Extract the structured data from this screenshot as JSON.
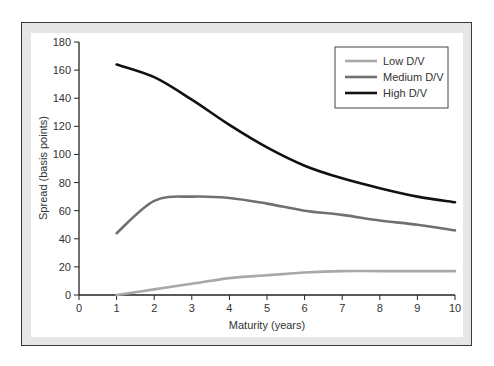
{
  "chart_data": {
    "type": "line",
    "title": "",
    "xlabel": "Maturity (years)",
    "ylabel": "Spread (basis points)",
    "xlim": [
      0,
      10
    ],
    "ylim": [
      0,
      180
    ],
    "xticks": [
      0,
      1,
      2,
      3,
      4,
      5,
      6,
      7,
      8,
      9,
      10
    ],
    "yticks": [
      0,
      20,
      40,
      60,
      80,
      100,
      120,
      140,
      160,
      180
    ],
    "grid": false,
    "legend_position": "upper right",
    "x": [
      1,
      2,
      3,
      4,
      5,
      6,
      7,
      8,
      9,
      10
    ],
    "series": [
      {
        "name": "Low D/V",
        "color": "#a8a8a8",
        "values": [
          0,
          4,
          8,
          12,
          14,
          16,
          17,
          17,
          17,
          17
        ]
      },
      {
        "name": "Medium D/V",
        "color": "#707070",
        "values": [
          44,
          67,
          70,
          69,
          65,
          60,
          57,
          53,
          50,
          46
        ]
      },
      {
        "name": "High D/V",
        "color": "#111111",
        "values": [
          164,
          155,
          139,
          121,
          105,
          92,
          83,
          76,
          70,
          66
        ]
      }
    ]
  }
}
